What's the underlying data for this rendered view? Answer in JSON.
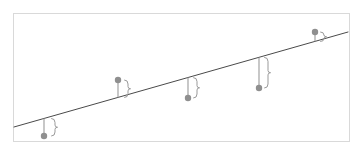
{
  "figure": {
    "kind": "residual-scatter-diagram",
    "title": "",
    "background_color": "#ffffff",
    "frame": {
      "border_color": "#d9d9d9",
      "border_width": 1,
      "x": 13,
      "y": 13,
      "width": 337,
      "height": 129
    },
    "regression_line": {
      "label": "",
      "color": "#4a4a4a",
      "width": 1,
      "x1": 14,
      "y1": 127,
      "x2": 348,
      "y2": 32
    },
    "marker": {
      "color": "#8f8f8f",
      "radius": 3.2
    },
    "stem": {
      "color": "#9a9a9a",
      "width": 1.1
    },
    "brace": {
      "color": "#9a9a9a",
      "width": 1.0
    }
  },
  "chart_data": {
    "type": "scatter",
    "title": "",
    "xlabel": "",
    "ylabel": "",
    "grid": false,
    "legend": "none",
    "annotations": [
      "brace-residual-1",
      "brace-residual-2",
      "brace-residual-3",
      "brace-residual-4",
      "brace-residual-5"
    ],
    "points": [
      {
        "label": "p1",
        "x": 44,
        "y": 136,
        "line_y": 118.5,
        "residual": -17.5,
        "side": "below",
        "brace_x": 55
      },
      {
        "label": "p2",
        "x": 118,
        "y": 80,
        "line_y": 97.5,
        "residual": 17.5,
        "side": "above",
        "brace_x": 128
      },
      {
        "label": "p3",
        "x": 188,
        "y": 98,
        "line_y": 77.6,
        "residual": -20.4,
        "side": "below",
        "brace_x": 197
      },
      {
        "label": "p4",
        "x": 259,
        "y": 88,
        "line_y": 57.4,
        "residual": -30.6,
        "side": "below",
        "brace_x": 268
      },
      {
        "label": "p5",
        "x": 315,
        "y": 32,
        "line_y": 41.5,
        "residual": 9.5,
        "side": "above",
        "brace_x": 324
      }
    ],
    "regression_line_endpoints": {
      "x1": 14,
      "y1": 127,
      "x2": 348,
      "y2": 32
    },
    "note": "Each point is joined to the fitted line by a vertical stem; a curly brace marks the residual length."
  }
}
